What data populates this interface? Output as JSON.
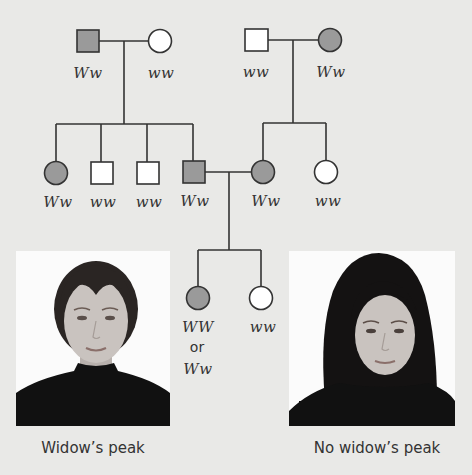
{
  "colors": {
    "background": "#e9e9e7",
    "affected_fill": "#9a9a9a",
    "unaffected_fill": "#ffffff",
    "line": "#333333",
    "photo_bg": "#fbfbfb",
    "clothing": "#111111",
    "skin": "#c9c3bf",
    "hair_left": "#2a2523",
    "hair_right": "#141212"
  },
  "pedigree": {
    "generation_1": {
      "left_couple": {
        "father": {
          "sex": "male",
          "affected": true,
          "genotype": "Ww"
        },
        "mother": {
          "sex": "female",
          "affected": false,
          "genotype": "ww"
        }
      },
      "right_couple": {
        "father": {
          "sex": "male",
          "affected": false,
          "genotype": "ww"
        },
        "mother": {
          "sex": "female",
          "affected": true,
          "genotype": "Ww"
        }
      }
    },
    "generation_2": {
      "left_siblings": [
        {
          "sex": "female",
          "affected": true,
          "genotype": "Ww"
        },
        {
          "sex": "male",
          "affected": false,
          "genotype": "ww"
        },
        {
          "sex": "male",
          "affected": false,
          "genotype": "ww"
        },
        {
          "sex": "male",
          "affected": true,
          "genotype": "Ww"
        }
      ],
      "right_siblings": [
        {
          "sex": "female",
          "affected": true,
          "genotype": "Ww"
        },
        {
          "sex": "female",
          "affected": false,
          "genotype": "ww"
        }
      ]
    },
    "generation_3": {
      "children": [
        {
          "sex": "female",
          "affected": true,
          "genotype_line1": "WW",
          "genotype_or": "or",
          "genotype_line2": "Ww"
        },
        {
          "sex": "female",
          "affected": false,
          "genotype": "ww"
        }
      ]
    }
  },
  "photos": {
    "left": {
      "caption": "Widow’s peak"
    },
    "right": {
      "caption": "No widow’s peak"
    }
  }
}
